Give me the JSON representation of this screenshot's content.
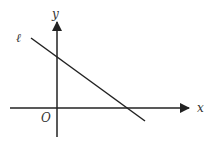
{
  "diagram": {
    "type": "coordinate-plane",
    "labels": {
      "x_axis": "x",
      "y_axis": "y",
      "origin": "O",
      "line": "ℓ"
    },
    "colors": {
      "stroke": "#222222",
      "background": "#ffffff"
    }
  }
}
